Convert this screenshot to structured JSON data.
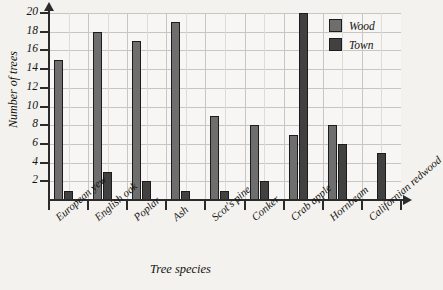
{
  "chart_data": {
    "type": "bar",
    "title": "",
    "xlabel": "Tree species",
    "ylabel": "Number of trees",
    "categories": [
      "European yew",
      "English oak",
      "Poplar",
      "Ash",
      "Scot's pine",
      "Conker",
      "Crab apple",
      "Hornbeam",
      "Californian redwood"
    ],
    "series": [
      {
        "name": "Wood",
        "color": "#6e6e6e",
        "values": [
          15,
          18,
          17,
          19,
          9,
          8,
          7,
          8,
          0
        ]
      },
      {
        "name": "Town",
        "color": "#414141",
        "values": [
          1,
          3,
          2,
          1,
          1,
          2,
          20,
          6,
          5
        ]
      }
    ],
    "ylim": [
      0,
      20
    ],
    "yticks": [
      2,
      4,
      6,
      8,
      10,
      12,
      14,
      16,
      18,
      20
    ],
    "ytick_labels": [
      "2",
      "4",
      "6",
      "8",
      "10",
      "12",
      "14",
      "16",
      "18",
      "20"
    ],
    "grid": true,
    "legend_position": "top-right"
  },
  "legend": {
    "items": [
      {
        "label": "Wood",
        "color": "#6e6e6e"
      },
      {
        "label": "Town",
        "color": "#414141"
      }
    ]
  },
  "axis": {
    "y_title": "Number of trees",
    "x_title": "Tree species"
  }
}
